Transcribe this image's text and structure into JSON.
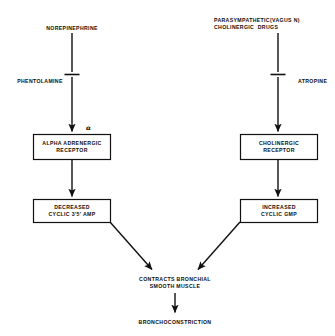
{
  "diagram": {
    "title_text": "",
    "background_color": "#ffffff",
    "stroke_color": "#111111",
    "text_color": "#0d0d0d",
    "branches": {
      "left": {
        "stimulus": {
          "lines": [
            "NOREPINEPHRINE"
          ]
        },
        "blocker": {
          "label": "PHENTOLAMINE",
          "symbol": "inhibition-bar"
        },
        "receptor_marker": "α",
        "receptor_box": {
          "lines": [
            "ALPHA ADRENERGIC",
            "RECEPTOR"
          ]
        },
        "effector_box": {
          "lines": [
            "DECREASED",
            "CYCLIC 3'5' AMP"
          ]
        }
      },
      "right": {
        "stimulus": {
          "lines": [
            "PARASYMPATHETIC(VAGUS N)",
            "CHOLINERGIC  DRUGS"
          ]
        },
        "blocker": {
          "label": "ATROPINE",
          "symbol": "inhibition-bar"
        },
        "receptor_box": {
          "lines": [
            "CHOLINERGIC",
            "RECEPTOR"
          ]
        },
        "effector_box": {
          "lines": [
            "INCREASED",
            "CYCLIC GMP"
          ]
        }
      }
    },
    "convergence": {
      "lines": [
        "CONTRACTS BRONCHIAL",
        "SMOOTH MUSCLE"
      ]
    },
    "outcome": {
      "lines": [
        "BRONCHOCONSTRICTION"
      ]
    }
  }
}
